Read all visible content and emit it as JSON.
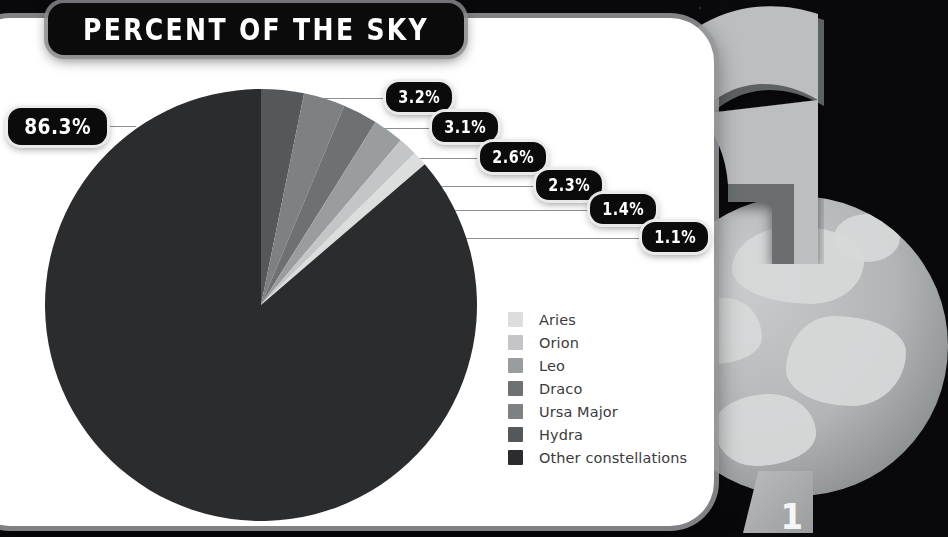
{
  "title": "PERCENT OF THE SKY",
  "page_number": "1",
  "colors": {
    "card": "#ffffff",
    "badge": "#0b0b0b",
    "badge_text": "#ffffff",
    "backdrop": "#0a0a0e",
    "leader_line": "#8d8f92",
    "legend_text": "#3b3b3d",
    "arrow_face": "#bcbec0",
    "arrow_shadow": "#5a5d5f",
    "planet": "#b2b5b6"
  },
  "legend": {
    "items": [
      {
        "label": "Aries",
        "color": "#dcdddd"
      },
      {
        "label": "Orion",
        "color": "#c3c5c6"
      },
      {
        "label": "Leo",
        "color": "#9a9d9f"
      },
      {
        "label": "Draco",
        "color": "#6e7173"
      },
      {
        "label": "Ursa Major",
        "color": "#7e8183"
      },
      {
        "label": "Hydra",
        "color": "#55585a"
      },
      {
        "label": "Other constellations",
        "color": "#2b2c2e"
      }
    ]
  },
  "callouts": [
    {
      "name": "other",
      "value": "86.3%"
    },
    {
      "name": "hydra",
      "value": "3.2%"
    },
    {
      "name": "ursa-major",
      "value": "3.1%"
    },
    {
      "name": "draco",
      "value": "2.6%"
    },
    {
      "name": "leo",
      "value": "2.3%"
    },
    {
      "name": "orion",
      "value": "1.4%"
    },
    {
      "name": "aries",
      "value": "1.1%"
    }
  ],
  "chart_data": {
    "type": "pie",
    "title": "PERCENT OF THE SKY",
    "unit": "percent",
    "start_angle_deg": -90,
    "direction": "clockwise",
    "labels": [
      "Hydra",
      "Ursa Major",
      "Draco",
      "Leo",
      "Orion",
      "Aries",
      "Other constellations"
    ],
    "values": [
      3.2,
      3.1,
      2.6,
      2.3,
      1.4,
      1.1,
      86.3
    ],
    "colors": [
      "#55585a",
      "#7e8183",
      "#6e7173",
      "#9a9d9f",
      "#c3c5c6",
      "#dcdddd",
      "#2b2c2e"
    ],
    "legend_order": [
      "Aries",
      "Orion",
      "Leo",
      "Draco",
      "Ursa Major",
      "Hydra",
      "Other constellations"
    ],
    "legend_position": "right",
    "data_labels": [
      "3.2%",
      "3.1%",
      "2.6%",
      "2.3%",
      "1.4%",
      "1.1%",
      "86.3%"
    ],
    "total": 100.0
  }
}
